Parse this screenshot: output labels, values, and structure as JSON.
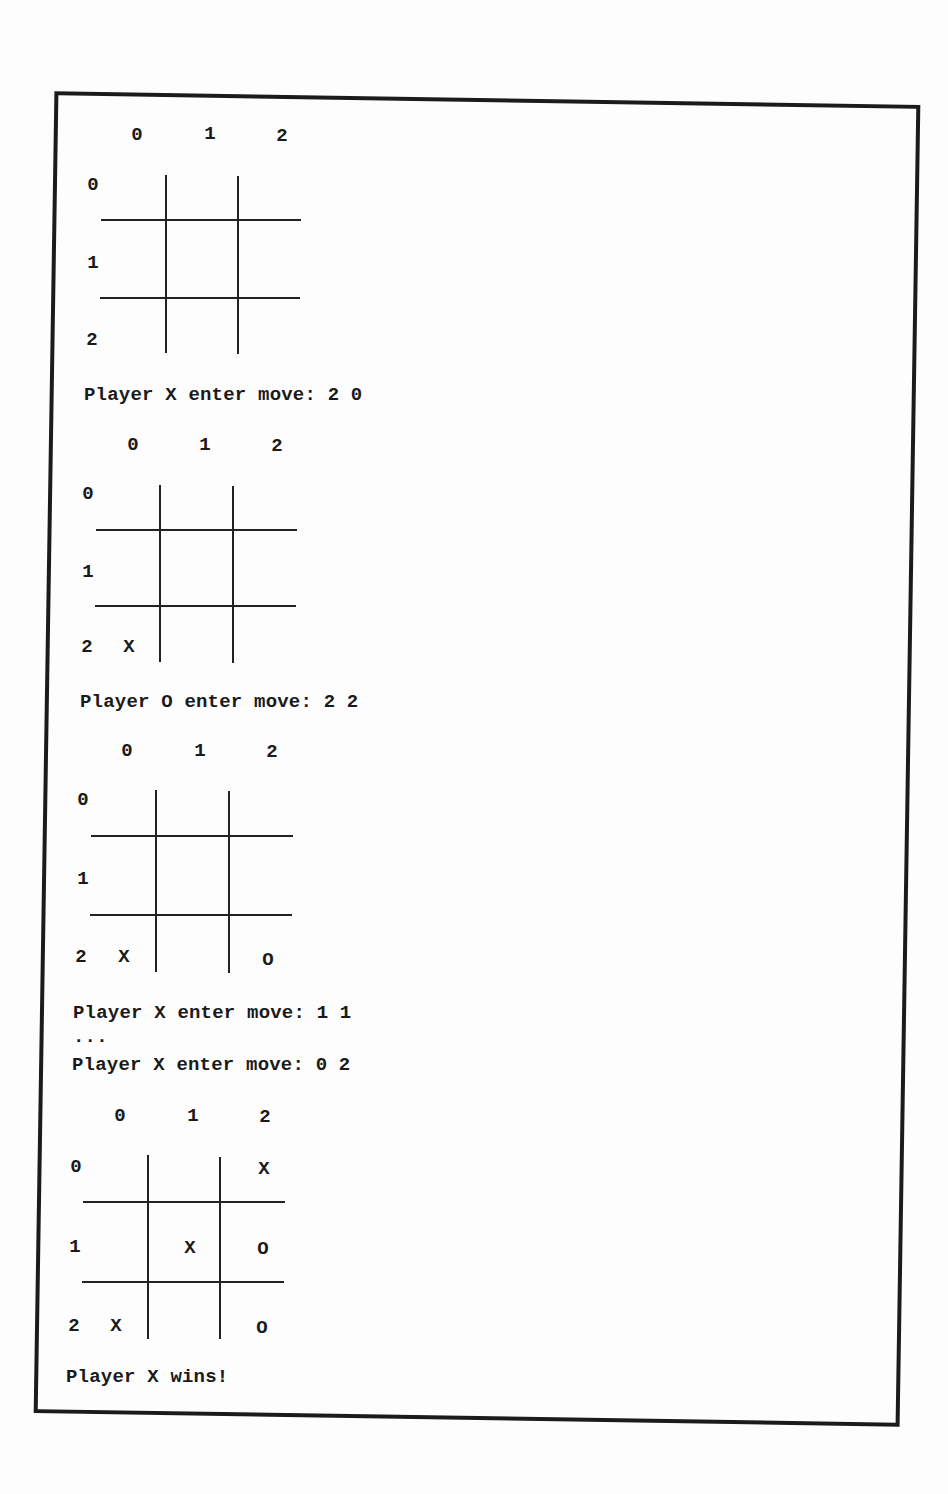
{
  "document": {
    "type": "console transcript figure",
    "col_labels": [
      "0",
      "1",
      "2"
    ],
    "row_labels": [
      "0",
      "1",
      "2"
    ]
  },
  "boards": [
    {
      "cells": [
        [
          "",
          "",
          ""
        ],
        [
          "",
          "",
          ""
        ],
        [
          "",
          "",
          ""
        ]
      ],
      "prompt": "Player X enter move: 2 0"
    },
    {
      "cells": [
        [
          "",
          "",
          ""
        ],
        [
          "",
          "",
          ""
        ],
        [
          "X",
          "",
          ""
        ]
      ],
      "prompt": "Player O enter move: 2 2"
    },
    {
      "cells": [
        [
          "",
          "",
          ""
        ],
        [
          "",
          "",
          ""
        ],
        [
          "X",
          "",
          "O"
        ]
      ],
      "prompt": "Player X enter move: 1 1",
      "ellipsis": "...",
      "prompt2": "Player X enter move: 0 2"
    },
    {
      "cells": [
        [
          "",
          "",
          "X"
        ],
        [
          "",
          "X",
          "O"
        ],
        [
          "X",
          "",
          "O"
        ]
      ],
      "result": "Player X wins!"
    }
  ]
}
